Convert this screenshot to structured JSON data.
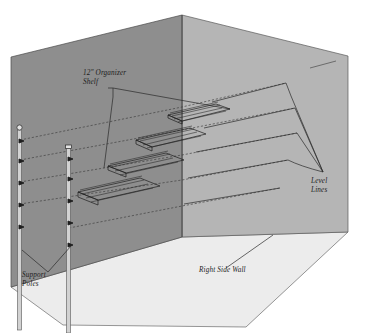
{
  "illustration": {
    "title": "Closet Organizer Shelf Isometric Installation Diagram",
    "background_color": "#ffffff"
  },
  "colors": {
    "left_wall": "#8e8e8e",
    "right_wall": "#b5b5b5",
    "floor": "#ececec",
    "edge_line": "#4a4a4a",
    "label_text": "#1c1c1c",
    "leader_line": "#2a2a2a",
    "shelf_line": "#1e1e1e",
    "pole_fill": "#d2d2d2",
    "pole_stroke": "#555555"
  },
  "labels": {
    "organizer_shelf": {
      "line1": "12\" Organizer",
      "line2": "Shelf",
      "x": 83,
      "y": 75
    },
    "level_lines": {
      "line1": "Level",
      "line2": "Lines",
      "x": 311,
      "y": 183
    },
    "support_poles": {
      "line1": "Support",
      "line2": "Poles",
      "x": 22,
      "y": 277
    },
    "right_side_wall": {
      "line1": "Right Side Wall",
      "x": 199,
      "y": 272
    }
  },
  "geometry": {
    "left_wall_polygon": "11,57 182,15 182,237 11,287",
    "right_wall_polygon": "182,15 348,56 348,232 182,237",
    "floor_polygon": "11,287 182,237 348,232 246,327 63,325",
    "corner_vertical": {
      "x": 182,
      "y1": 15,
      "y2": 237
    },
    "right_wall_tick": {
      "x1": 310,
      "y1": 68,
      "x2": 336,
      "y2": 61
    }
  },
  "shelves": [
    {
      "id": "shelf-1",
      "level": 1,
      "note": "topmost shelf, rear right"
    },
    {
      "id": "shelf-2",
      "level": 2,
      "note": "second shelf"
    },
    {
      "id": "shelf-3",
      "level": 3,
      "note": "third shelf"
    },
    {
      "id": "shelf-4",
      "level": 4,
      "note": "bottom shelf, front left"
    }
  ],
  "level_lines": [
    {
      "id": "level-line-1",
      "level": 1
    },
    {
      "id": "level-line-2",
      "level": 2
    },
    {
      "id": "level-line-3",
      "level": 3
    },
    {
      "id": "level-line-4",
      "level": 4
    }
  ],
  "support_poles": [
    {
      "id": "pole-left",
      "x": 20,
      "top_y": 127,
      "bottom_y": 330,
      "tick_count": 5
    },
    {
      "id": "pole-right",
      "x": 69,
      "top_y": 145,
      "bottom_y": 333,
      "tick_count": 5
    }
  ]
}
